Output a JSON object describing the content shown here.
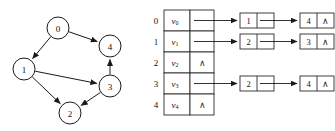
{
  "figure": {
    "kind": "graph-and-adjacency-list-diagram",
    "background": "#ffffff",
    "stroke_color": "#1a1a1a"
  },
  "graph": {
    "directed": true,
    "nodes": [
      {
        "id": "0",
        "label": "0",
        "x": 58,
        "y": 28
      },
      {
        "id": "1",
        "label": "1",
        "x": 24,
        "y": 69
      },
      {
        "id": "2",
        "label": "2",
        "x": 70,
        "y": 113
      },
      {
        "id": "3",
        "label": "3",
        "x": 110,
        "y": 86
      },
      {
        "id": "4",
        "label": "4",
        "x": 110,
        "y": 46
      }
    ],
    "node_radius": 11,
    "edges": [
      {
        "from": "0",
        "to": "1"
      },
      {
        "from": "0",
        "to": "4"
      },
      {
        "from": "1",
        "to": "3"
      },
      {
        "from": "1",
        "to": "2"
      },
      {
        "from": "3",
        "to": "2"
      },
      {
        "from": "3",
        "to": "4"
      }
    ]
  },
  "adjacency": {
    "null_symbol": "∧",
    "rows": [
      {
        "index": "0",
        "vertex": "v",
        "subscript": "0",
        "has_list": true,
        "nodes": [
          {
            "value": "1",
            "next": true
          },
          {
            "value": "4",
            "next": false
          }
        ]
      },
      {
        "index": "1",
        "vertex": "v",
        "subscript": "1",
        "has_list": true,
        "nodes": [
          {
            "value": "2",
            "next": true
          },
          {
            "value": "3",
            "next": false
          }
        ]
      },
      {
        "index": "2",
        "vertex": "v",
        "subscript": "2",
        "has_list": false,
        "nodes": []
      },
      {
        "index": "3",
        "vertex": "v",
        "subscript": "3",
        "has_list": true,
        "nodes": [
          {
            "value": "2",
            "next": true
          },
          {
            "value": "4",
            "next": false
          }
        ]
      },
      {
        "index": "4",
        "vertex": "v",
        "subscript": "4",
        "has_list": false,
        "nodes": []
      }
    ]
  }
}
